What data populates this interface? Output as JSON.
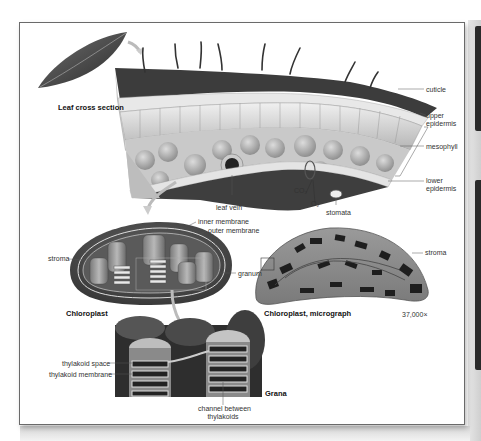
{
  "figure": {
    "title_labels": {
      "leaf_cross_section": "Leaf cross section",
      "chloroplast": "Chloroplast",
      "chloroplast_micrograph": "Chloroplast, micrograph",
      "grana": "Grana"
    },
    "leaf_labels": {
      "cuticle": "cuticle",
      "upper_epidermis_1": "upper",
      "upper_epidermis_2": "epidermis",
      "mesophyll": "mesophyll",
      "lower_epidermis_1": "lower",
      "lower_epidermis_2": "epidermis",
      "leaf_vein": "leaf vein",
      "stomata": "stomata",
      "co2": "CO₂",
      "o2": "O₂"
    },
    "chloroplast_labels": {
      "inner_membrane": "inner membrane",
      "outer_membrane": "outer membrane",
      "stroma": "stroma",
      "granum": "granum"
    },
    "micrograph_labels": {
      "stroma": "stroma",
      "magnification": "37,000×"
    },
    "grana_labels": {
      "thylakoid_space": "thylakoid space",
      "thylakoid_membrane": "thylakoid membrane",
      "channel_1": "channel between",
      "channel_2": "thylakoids"
    },
    "colors": {
      "frame_border": "#6a6a6a",
      "leaf_dark": "#3a3a3a",
      "cell_light": "#d8d8d8",
      "chloroplast_outer": "#4a4a4a",
      "grana_bg": "#2e2e2e"
    }
  }
}
